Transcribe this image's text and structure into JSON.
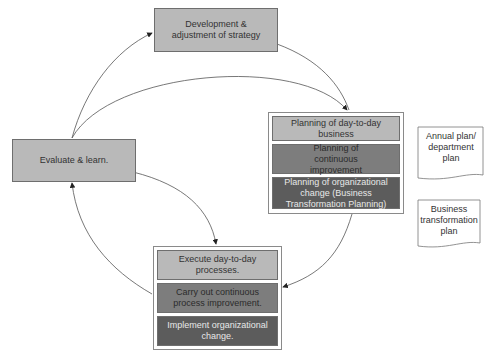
{
  "diagram": {
    "strategy_box": "Development & adjustment of strategy",
    "evaluate_box": "Evaluate & learn.",
    "planning_group": {
      "items": [
        "Planning of day-to-day business",
        "Planning of continuous improvement",
        "Planning of organizational change (Business Transformation Planning)"
      ]
    },
    "execution_group": {
      "items": [
        "Execute day-to-day processes.",
        "Carry out continuous process improvement.",
        "Implement organizational change."
      ]
    },
    "documents": {
      "annual_plan": "Annual plan/ department plan",
      "transformation_plan": "Business transformation plan"
    },
    "colors": {
      "light": "#b9b9b9",
      "mid": "#7d7d7d",
      "dark": "#5c5c5c"
    }
  }
}
